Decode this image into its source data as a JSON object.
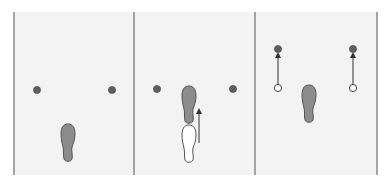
{
  "diagram": {
    "colors": {
      "background": "#ffffff",
      "panel_fill": "#f3f3f3",
      "divider": "#6e6e6e",
      "marker_fill": "#5e5e5e",
      "footprint_fill": "#8c8c8c",
      "footprint_stroke": "#555555",
      "ghost_fill": "#ffffff",
      "arrow": "#333333"
    },
    "dividers_x": [
      14,
      134,
      255,
      377
    ],
    "panels": [
      {
        "id": "panel-1",
        "markers": [
          {
            "x": 37,
            "y": 90
          },
          {
            "x": 112,
            "y": 90
          }
        ],
        "footprints": [
          {
            "x": 68,
            "y": 143,
            "style": "filled"
          }
        ],
        "arrows": []
      },
      {
        "id": "panel-2",
        "markers": [
          {
            "x": 157,
            "y": 89
          },
          {
            "x": 233,
            "y": 89
          }
        ],
        "footprints": [
          {
            "x": 189,
            "y": 105,
            "style": "filled"
          },
          {
            "x": 189,
            "y": 144,
            "style": "outline"
          }
        ],
        "arrows": [
          {
            "x1": 199,
            "y1": 143,
            "x2": 199,
            "y2": 111
          }
        ]
      },
      {
        "id": "panel-3",
        "markers": [
          {
            "x": 278,
            "y": 49,
            "style": "filled"
          },
          {
            "x": 278,
            "y": 88,
            "style": "outline"
          },
          {
            "x": 353,
            "y": 49,
            "style": "filled"
          },
          {
            "x": 353,
            "y": 88,
            "style": "outline"
          }
        ],
        "footprints": [
          {
            "x": 309,
            "y": 104,
            "style": "filled"
          }
        ],
        "arrows": [
          {
            "x1": 278,
            "y1": 84,
            "x2": 278,
            "y2": 55
          },
          {
            "x1": 353,
            "y1": 84,
            "x2": 353,
            "y2": 55
          }
        ]
      }
    ]
  }
}
